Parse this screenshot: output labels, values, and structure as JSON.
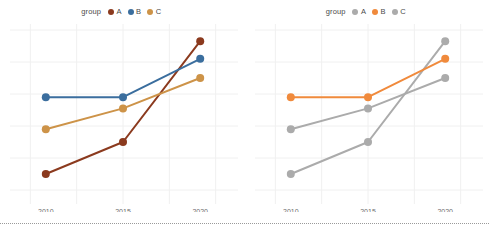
{
  "figure": {
    "background": "#ffffff",
    "panel_count": 2,
    "separator": "dotted-rule"
  },
  "chart_data": [
    {
      "type": "line",
      "title": "",
      "subtitle": "",
      "xlabel": "",
      "ylabel": "",
      "x": [
        2010,
        2015,
        2020
      ],
      "xtick_labels": [
        "2010",
        "2015",
        "2020"
      ],
      "ytick_labels": [],
      "xlim": [
        2008.2,
        2021.8
      ],
      "ylim": [
        0,
        100
      ],
      "grid": true,
      "grid_color": "#f0f0f0",
      "legend": {
        "title": "group",
        "position": "top-center",
        "entries": [
          {
            "label": "A",
            "color": "#8B3A1E"
          },
          {
            "label": "B",
            "color": "#3B6E9E"
          },
          {
            "label": "C",
            "color": "#CD9348"
          }
        ]
      },
      "markers": true,
      "marker_size": 4,
      "line_width": 2,
      "series": [
        {
          "name": "A",
          "color": "#8B3A1E",
          "values": [
            10,
            30,
            93
          ]
        },
        {
          "name": "B",
          "color": "#3B6E9E",
          "values": [
            58,
            58,
            82
          ]
        },
        {
          "name": "C",
          "color": "#CD9348",
          "values": [
            38,
            51,
            70
          ]
        }
      ]
    },
    {
      "type": "line",
      "title": "",
      "subtitle": "",
      "xlabel": "",
      "ylabel": "",
      "x": [
        2010,
        2015,
        2020
      ],
      "xtick_labels": [
        "2010",
        "2015",
        "2020"
      ],
      "ytick_labels": [],
      "xlim": [
        2008.2,
        2021.8
      ],
      "ylim": [
        0,
        100
      ],
      "grid": true,
      "grid_color": "#f0f0f0",
      "legend": {
        "title": "group",
        "position": "top-center",
        "entries": [
          {
            "label": "A",
            "color": "#ABABAB"
          },
          {
            "label": "B",
            "color": "#F08A3C"
          },
          {
            "label": "C",
            "color": "#ABABAB"
          }
        ]
      },
      "markers": true,
      "marker_size": 4,
      "line_width": 2,
      "highlight": "B",
      "series": [
        {
          "name": "A",
          "color": "#ABABAB",
          "values": [
            10,
            30,
            93
          ]
        },
        {
          "name": "B",
          "color": "#F08A3C",
          "values": [
            58,
            58,
            82
          ]
        },
        {
          "name": "C",
          "color": "#ABABAB",
          "values": [
            38,
            51,
            70
          ]
        }
      ]
    }
  ]
}
